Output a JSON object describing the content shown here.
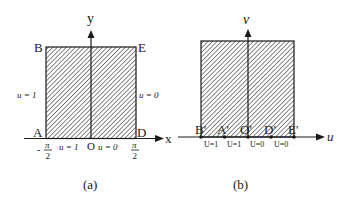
{
  "figure_a": {
    "caption": "(a)",
    "axes": {
      "x_label": "x",
      "y_label": "y",
      "origin_label": "O"
    },
    "vertices": {
      "A": "A",
      "B": "B",
      "D": "D",
      "E": "E"
    },
    "boundary_left": "u = 1",
    "boundary_right": "u = 0",
    "bottom_left": "u = 1",
    "bottom_right": "u = 0",
    "tick_left": {
      "sign": "-",
      "num": "π",
      "den": "2"
    },
    "tick_right": {
      "num": "π",
      "den": "2"
    }
  },
  "figure_b": {
    "caption": "(b)",
    "axes": {
      "x_label": "u",
      "y_label": "v"
    },
    "points": [
      "B'",
      "A'",
      "O'",
      "D'",
      "E'"
    ],
    "segment_labels": [
      "U=1",
      "U=1",
      "U=0",
      "U=0"
    ]
  },
  "colors": {
    "line": "#1a1a1a",
    "hatch": "#4a4a4a",
    "background": "#ffffff"
  }
}
